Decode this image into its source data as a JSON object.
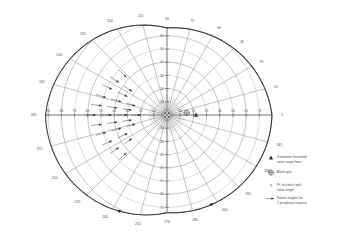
{
  "chart_data": {
    "type": "polar-diagram",
    "grid": true,
    "legend_position": "right",
    "center": {
      "x": 167,
      "y": 115
    },
    "radial_scale_deg_per_unit": 1,
    "pixels_per_10_deg": 13.2,
    "meridian_labels": [
      {
        "deg": 0,
        "label": "0"
      },
      {
        "deg": 15,
        "label": "15"
      },
      {
        "deg": 30,
        "label": "30"
      },
      {
        "deg": 45,
        "label": "45"
      },
      {
        "deg": 60,
        "label": "60"
      },
      {
        "deg": 75,
        "label": "75"
      },
      {
        "deg": 90,
        "label": "90"
      },
      {
        "deg": 105,
        "label": "105"
      },
      {
        "deg": 120,
        "label": "120"
      },
      {
        "deg": 135,
        "label": "135"
      },
      {
        "deg": 150,
        "label": "150"
      },
      {
        "deg": 165,
        "label": "165"
      },
      {
        "deg": 180,
        "label": "180"
      },
      {
        "deg": 195,
        "label": "195"
      },
      {
        "deg": 210,
        "label": "210"
      },
      {
        "deg": 225,
        "label": "225"
      },
      {
        "deg": 240,
        "label": "240"
      },
      {
        "deg": 255,
        "label": "255"
      },
      {
        "deg": 270,
        "label": "270"
      },
      {
        "deg": 285,
        "label": "285"
      },
      {
        "deg": 300,
        "label": "300"
      },
      {
        "deg": 315,
        "label": "315"
      },
      {
        "deg": 330,
        "label": "330"
      },
      {
        "deg": 345,
        "label": "345"
      }
    ],
    "eccentricity_rings_deg": [
      10,
      20,
      30,
      40,
      50,
      60,
      70,
      80,
      90
    ],
    "vertical_axis_labels_up": [
      "10",
      "20",
      "30",
      "40",
      "50",
      "60",
      "70"
    ],
    "vertical_axis_labels_down": [
      "10",
      "20",
      "30",
      "40",
      "50",
      "60",
      "70"
    ],
    "horizontal_axis_labels_right": [
      "10",
      "20",
      "30",
      "40",
      "50",
      "60",
      "70",
      "80",
      "90"
    ],
    "horizontal_axis_labels_left": [
      "10",
      "20",
      "30",
      "40",
      "50",
      "60",
      "70",
      "80",
      "90"
    ],
    "blind_spot": {
      "deg_x": 15,
      "deg_y": 2,
      "symbol": "crossed-circle"
    },
    "threshold_marker": {
      "deg_x": 22,
      "deg_y": 0,
      "symbol": "filled-triangle"
    },
    "kinetic_arrow_count": 26,
    "kinetic_arrow_direction": "inward toward fixation",
    "kinetic_arrow_hemifield": "left (nasal)",
    "boundary_arrowheads": 2
  },
  "legend": {
    "items": [
      {
        "symbol": "filled-triangle",
        "line1": "Determine threshold",
        "line2": "static target here"
      },
      {
        "symbol": "crossed-circle",
        "line1": "Blind spot",
        "line2": ""
      },
      {
        "symbol": "point-marker",
        "line1": "Pt. to check with",
        "line2": "static target"
      },
      {
        "symbol": "arrow",
        "line1": "Kinetic targets for",
        "line2": "2 peripheral isopters"
      }
    ]
  },
  "colors": {
    "grid": "#7a7a7a",
    "grid_faint": "#9a9a9a",
    "boundary": "#3a3a3a",
    "text": "#4a4a4a",
    "marker": "#2f2f2f",
    "background": "#ffffff"
  }
}
